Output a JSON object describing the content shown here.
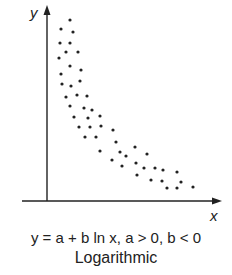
{
  "chart_data": {
    "type": "scatter",
    "title": "Logarithmic",
    "subtitle": "y = a + b ln x, a > 0, b < 0",
    "xlabel": "x",
    "ylabel": "y",
    "grid": false,
    "legend": null,
    "ticks": "none",
    "pixel_frame": {
      "origin_x": 47,
      "origin_y": 201,
      "x_end": 220,
      "y_end": 8
    },
    "points": [
      [
        70,
        20
      ],
      [
        61,
        29
      ],
      [
        73,
        32
      ],
      [
        60,
        43
      ],
      [
        70,
        43
      ],
      [
        66,
        52
      ],
      [
        78,
        52
      ],
      [
        59,
        58
      ],
      [
        70,
        66
      ],
      [
        81,
        70
      ],
      [
        61,
        74
      ],
      [
        80,
        81
      ],
      [
        62,
        84
      ],
      [
        71,
        86
      ],
      [
        66,
        97
      ],
      [
        77,
        95
      ],
      [
        87,
        96
      ],
      [
        70,
        106
      ],
      [
        84,
        108
      ],
      [
        92,
        110
      ],
      [
        74,
        117
      ],
      [
        88,
        118
      ],
      [
        100,
        116
      ],
      [
        79,
        127
      ],
      [
        90,
        127
      ],
      [
        101,
        126
      ],
      [
        85,
        137
      ],
      [
        96,
        137
      ],
      [
        113,
        130
      ],
      [
        100,
        151
      ],
      [
        116,
        142
      ],
      [
        120,
        152
      ],
      [
        112,
        160
      ],
      [
        126,
        156
      ],
      [
        135,
        147
      ],
      [
        147,
        154
      ],
      [
        122,
        166
      ],
      [
        136,
        163
      ],
      [
        144,
        168
      ],
      [
        137,
        175
      ],
      [
        151,
        180
      ],
      [
        155,
        168
      ],
      [
        163,
        170
      ],
      [
        177,
        172
      ],
      [
        162,
        181
      ],
      [
        167,
        188
      ],
      [
        177,
        188
      ],
      [
        181,
        182
      ],
      [
        193,
        187
      ]
    ]
  },
  "colors": {
    "ink": "#222222",
    "background": "#ffffff"
  },
  "caption": {
    "equation": "y = a + b ln x, a > 0, b < 0",
    "type_label": "Logarithmic"
  }
}
